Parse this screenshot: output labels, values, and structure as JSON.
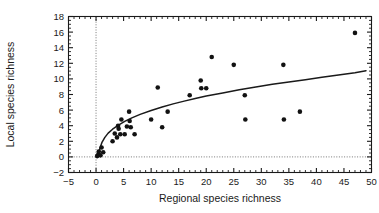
{
  "chart_data": {
    "type": "scatter",
    "title": "",
    "xlabel": "Regional species richness",
    "ylabel": "Local species richness",
    "xlim": [
      -5,
      50
    ],
    "ylim": [
      -2,
      18
    ],
    "xticks": [
      -5,
      0,
      5,
      10,
      15,
      20,
      25,
      30,
      35,
      40,
      45,
      50
    ],
    "xtick_labels": [
      "−5",
      "0",
      "5",
      "10",
      "15",
      "20",
      "25",
      "30",
      "35",
      "40",
      "45",
      "50"
    ],
    "yticks": [
      -2,
      0,
      2,
      4,
      6,
      8,
      10,
      12,
      14,
      16,
      18
    ],
    "ytick_labels": [
      "−2",
      "0",
      "2",
      "4",
      "6",
      "8",
      "10",
      "12",
      "14",
      "16",
      "18"
    ],
    "grid": false,
    "legend": null,
    "reference_lines": [
      {
        "orientation": "vertical",
        "value": 0,
        "style": "dotted"
      },
      {
        "orientation": "horizontal",
        "value": 0,
        "style": "dotted"
      }
    ],
    "series": [
      {
        "name": "Local vs regional species richness",
        "marker": "filled-circle",
        "color": "#121212",
        "points": [
          [
            0.2,
            0.1
          ],
          [
            0.4,
            0.3
          ],
          [
            0.5,
            0.7
          ],
          [
            0.8,
            0.2
          ],
          [
            1.0,
            1.2
          ],
          [
            1.3,
            0.6
          ],
          [
            3.0,
            2.0
          ],
          [
            3.4,
            3.0
          ],
          [
            3.8,
            2.5
          ],
          [
            4.0,
            4.0
          ],
          [
            4.1,
            3.6
          ],
          [
            4.4,
            2.9
          ],
          [
            4.6,
            4.8
          ],
          [
            5.2,
            2.9
          ],
          [
            5.6,
            3.9
          ],
          [
            6.0,
            5.8
          ],
          [
            6.1,
            4.6
          ],
          [
            6.3,
            3.8
          ],
          [
            7.0,
            2.9
          ],
          [
            10.0,
            4.8
          ],
          [
            11.2,
            8.9
          ],
          [
            12.0,
            3.8
          ],
          [
            13.0,
            5.8
          ],
          [
            17.0,
            7.9
          ],
          [
            19.0,
            9.8
          ],
          [
            19.1,
            8.8
          ],
          [
            20.0,
            8.8
          ],
          [
            21.0,
            12.8
          ],
          [
            25.0,
            11.8
          ],
          [
            27.0,
            7.9
          ],
          [
            27.1,
            4.8
          ],
          [
            34.0,
            11.8
          ],
          [
            34.1,
            4.8
          ],
          [
            37.0,
            5.8
          ],
          [
            47.0,
            15.9
          ]
        ]
      }
    ],
    "fit_curve": {
      "name": "saturating fit",
      "style": "solid",
      "color": "#1a1a1a",
      "points": [
        [
          0.35,
          0.15
        ],
        [
          0.7,
          1.1
        ],
        [
          1.1,
          1.9
        ],
        [
          1.6,
          2.5
        ],
        [
          2.2,
          3.05
        ],
        [
          3.0,
          3.55
        ],
        [
          4.0,
          4.05
        ],
        [
          5.2,
          4.55
        ],
        [
          6.5,
          5.0
        ],
        [
          8.0,
          5.45
        ],
        [
          10.0,
          5.95
        ],
        [
          12.0,
          6.4
        ],
        [
          14.0,
          6.8
        ],
        [
          16.0,
          7.15
        ],
        [
          18.0,
          7.5
        ],
        [
          20.0,
          7.8
        ],
        [
          23.0,
          8.2
        ],
        [
          26.0,
          8.6
        ],
        [
          29.0,
          8.95
        ],
        [
          32.0,
          9.3
        ],
        [
          35.0,
          9.6
        ],
        [
          38.0,
          9.9
        ],
        [
          41.0,
          10.2
        ],
        [
          44.0,
          10.5
        ],
        [
          47.0,
          10.8
        ],
        [
          49.0,
          11.05
        ]
      ]
    }
  }
}
